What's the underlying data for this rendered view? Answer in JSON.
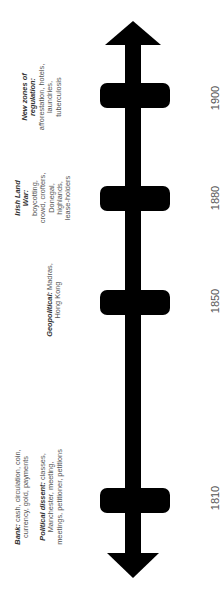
{
  "timeline": {
    "orientation": "vertical, bottom-to-top, rotated labels",
    "colors": {
      "axis": "#000000",
      "text": "#555555",
      "heading": "#333333",
      "background": "#ffffff"
    },
    "events": [
      {
        "year": "1900",
        "heading_lines": [
          "New zones of",
          "regulation:"
        ],
        "body_lines": [
          "afforestation, hotels,",
          "laundries,",
          "tuberculosis"
        ]
      },
      {
        "year": "1880",
        "heading_lines": [
          "Irish Land",
          "War:"
        ],
        "body_lines": [
          "boycotting,",
          "crowd, crofters,",
          "Donegal,",
          "highlands,",
          "lease-holders"
        ]
      },
      {
        "year": "1850",
        "heading_inline": "Geopolitical:",
        "first_line_rest": " Madras,",
        "body_lines": [
          "Hong Kong"
        ]
      },
      {
        "year": "1810",
        "groups": [
          {
            "heading_inline": "Bank:",
            "first_line_rest": " cash, circulation, coin,",
            "body_lines": [
              "currency, gold, payments"
            ]
          },
          {
            "heading_inline": "Political dissent:",
            "first_line_rest": " classes,",
            "body_lines": [
              "Manchester, meeting,",
              "meetings, petitioner, petitions"
            ]
          }
        ]
      }
    ]
  }
}
